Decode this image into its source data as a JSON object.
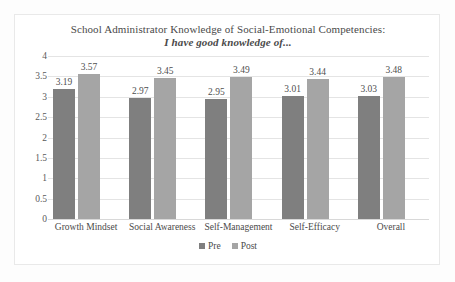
{
  "figure": {
    "background_color": "#fdfdfd",
    "frame_color": "#e9e9e9"
  },
  "chart_data": {
    "type": "bar",
    "title": "School Administrator Knowledge of Social-Emotional Competencies:",
    "subtitle": "I have good knowledge of...",
    "xlabel": "",
    "ylabel": "",
    "ylim": [
      0,
      4
    ],
    "ytick_labels": [
      "4",
      "3.5",
      "3",
      "2.5",
      "2",
      "1.5",
      "1",
      "0.5",
      "0"
    ],
    "ytick_values": [
      4,
      3.5,
      3,
      2.5,
      2,
      1.5,
      1,
      0.5,
      0
    ],
    "grid": true,
    "legend_position": "bottom-center",
    "categories": [
      "Growth Mindset",
      "Social Awareness",
      "Self-Management",
      "Self-Efficacy",
      "Overall"
    ],
    "series": [
      {
        "name": "Pre",
        "color": "#7f7f7f",
        "values": [
          3.19,
          2.97,
          2.95,
          3.01,
          3.03
        ],
        "labels": [
          "3.19",
          "2.97",
          "2.95",
          "3.01",
          "3.03"
        ]
      },
      {
        "name": "Post",
        "color": "#a5a5a5",
        "values": [
          3.57,
          3.45,
          3.49,
          3.44,
          3.48
        ],
        "labels": [
          "3.57",
          "3.45",
          "3.49",
          "3.44",
          "3.48"
        ]
      }
    ]
  }
}
